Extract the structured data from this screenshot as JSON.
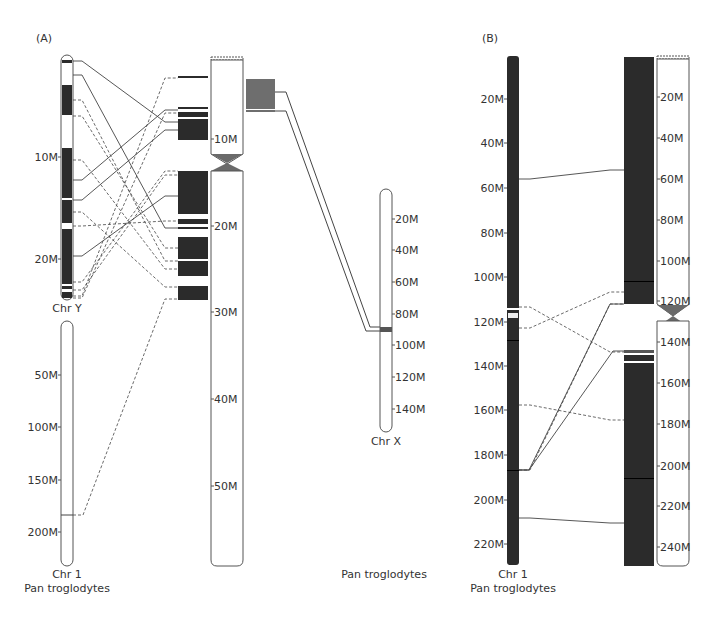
{
  "colors": {
    "band_dark": "#2b2b2b",
    "outline": "#555555",
    "line": "#444444",
    "centromere": "#6a6a6a",
    "x_link_box": "#6e6e6e",
    "x_band": "#555555"
  },
  "panel_a": {
    "label": "(A)",
    "chr_y": {
      "name": "Chr Y",
      "ticks": [
        {
          "label": "10M",
          "y": 157
        },
        {
          "label": "20M",
          "y": 259
        }
      ]
    },
    "chr_1": {
      "name": "Chr 1",
      "species": "Pan troglodytes",
      "ticks": [
        {
          "label": "50M",
          "y": 375
        },
        {
          "label": "100M",
          "y": 427
        },
        {
          "label": "150M",
          "y": 480
        },
        {
          "label": "200M",
          "y": 532
        }
      ]
    },
    "target": {
      "ticks": [
        {
          "label": "10M",
          "y": 139
        },
        {
          "label": "20M",
          "y": 226
        },
        {
          "label": "30M",
          "y": 312
        },
        {
          "label": "40M",
          "y": 399
        },
        {
          "label": "50M",
          "y": 486
        }
      ]
    },
    "chr_x": {
      "name": "Chr X",
      "ticks": [
        {
          "label": "20M",
          "y": 219
        },
        {
          "label": "40M",
          "y": 250
        },
        {
          "label": "60M",
          "y": 282
        },
        {
          "label": "80M",
          "y": 314
        },
        {
          "label": "100M",
          "y": 345
        },
        {
          "label": "120M",
          "y": 377
        },
        {
          "label": "140M",
          "y": 409
        }
      ]
    },
    "species_label": "Pan troglodytes"
  },
  "panel_b": {
    "label": "(B)",
    "chr_1": {
      "name": "Chr 1",
      "species": "Pan troglodytes",
      "ticks": [
        {
          "label": "20M",
          "y": 99
        },
        {
          "label": "40M",
          "y": 143
        },
        {
          "label": "60M",
          "y": 188
        },
        {
          "label": "80M",
          "y": 233
        },
        {
          "label": "100M",
          "y": 277
        },
        {
          "label": "120M",
          "y": 322
        },
        {
          "label": "140M",
          "y": 366
        },
        {
          "label": "160M",
          "y": 410
        },
        {
          "label": "180M",
          "y": 455
        },
        {
          "label": "200M",
          "y": 500
        },
        {
          "label": "220M",
          "y": 544
        }
      ]
    },
    "target": {
      "ticks": [
        {
          "label": "20M",
          "y": 97
        },
        {
          "label": "40M",
          "y": 138
        },
        {
          "label": "60M",
          "y": 179
        },
        {
          "label": "80M",
          "y": 220
        },
        {
          "label": "100M",
          "y": 261
        },
        {
          "label": "120M",
          "y": 301
        },
        {
          "label": "140M",
          "y": 342
        },
        {
          "label": "160M",
          "y": 383
        },
        {
          "label": "180M",
          "y": 424
        },
        {
          "label": "200M",
          "y": 466
        },
        {
          "label": "220M",
          "y": 506
        },
        {
          "label": "240M",
          "y": 547
        }
      ]
    }
  }
}
